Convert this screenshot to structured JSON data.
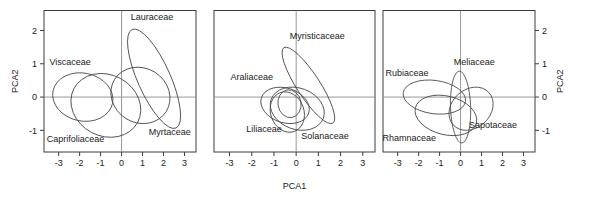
{
  "figure": {
    "type": "multi-panel-pca-ordination",
    "panel_count": 3,
    "axis_titles": {
      "x": "PCA1",
      "y_left": "PCA2",
      "y_right": "PCA2"
    },
    "tick_labels": {
      "x": [
        "-3",
        "-2",
        "-1",
        "0",
        "1",
        "2",
        "3"
      ],
      "y": [
        "2",
        "1",
        "0",
        "-1"
      ]
    },
    "colors": {
      "frame": "#3c3c3c",
      "zero_axis": "#8c8c8c",
      "ellipse": "#4a4a4a",
      "text": "#1a1a1a",
      "background": "#ffffff"
    }
  },
  "chart_data": {
    "type": "scatter",
    "title": "",
    "xlabel": "PCA1",
    "ylabel": "PCA2",
    "xlim": [
      -3.7,
      3.55
    ],
    "ylim": [
      -1.65,
      2.6
    ],
    "xticks": [
      -3,
      -2,
      -1,
      0,
      1,
      2,
      3
    ],
    "yticks": [
      2,
      1,
      0,
      -1
    ],
    "grid": false,
    "legend": "none",
    "annotations": "family names placed adjacent to their confidence ellipses",
    "panels": [
      {
        "index": 1,
        "yaxis_side": "left",
        "ellipses": [
          {
            "label": "Lauraceae",
            "cx": 1.55,
            "cy": 0.55,
            "rx": 0.78,
            "ry": 1.62,
            "rotation": 24,
            "label_x": 1.45,
            "label_y": 2.3
          },
          {
            "label": "Myrtaceae",
            "cx": 0.9,
            "cy": 0.05,
            "rx": 1.45,
            "ry": 0.82,
            "rotation": -32,
            "label_x": 2.3,
            "label_y": -1.15
          },
          {
            "label": "Viscaceae",
            "cx": -1.85,
            "cy": 0.0,
            "rx": 1.45,
            "ry": 0.72,
            "rotation": -12,
            "label_x": -2.45,
            "label_y": 0.95
          },
          {
            "label": "Caprifoliaceae",
            "cx": -0.75,
            "cy": -0.25,
            "rx": 1.72,
            "ry": 0.92,
            "rotation": -28,
            "label_x": -2.2,
            "label_y": -1.35
          }
        ]
      },
      {
        "index": 2,
        "yaxis_side": "none",
        "ellipses": [
          {
            "label": "Myristicaceae",
            "cx": 0.55,
            "cy": 0.35,
            "rx": 0.52,
            "ry": 1.35,
            "rotation": 33,
            "label_x": 0.95,
            "label_y": 1.75
          },
          {
            "label": "Araliaceae",
            "cx": -0.5,
            "cy": -0.25,
            "rx": 1.12,
            "ry": 0.52,
            "rotation": -18,
            "label_x": -2.0,
            "label_y": 0.5
          },
          {
            "label": "Liliaceae",
            "cx": -0.4,
            "cy": -0.45,
            "rx": 0.75,
            "ry": 0.62,
            "rotation": 20,
            "label_x": -1.45,
            "label_y": -1.05
          },
          {
            "label": "Solanaceae",
            "cx": 0.05,
            "cy": -0.35,
            "rx": 1.25,
            "ry": 0.62,
            "rotation": -20,
            "label_x": 1.3,
            "label_y": -1.25
          },
          {
            "label": "",
            "cx": -0.3,
            "cy": -0.2,
            "rx": 0.52,
            "ry": 0.42,
            "rotation": 10,
            "label_x": 0,
            "label_y": 0
          }
        ]
      },
      {
        "index": 3,
        "yaxis_side": "right",
        "ellipses": [
          {
            "label": "Rubiaceae",
            "cx": -1.25,
            "cy": 0.0,
            "rx": 1.5,
            "ry": 0.5,
            "rotation": -8,
            "label_x": -2.55,
            "label_y": 0.62
          },
          {
            "label": "Meliaceae",
            "cx": 0.0,
            "cy": -0.3,
            "rx": 0.48,
            "ry": 1.08,
            "rotation": 2,
            "label_x": 0.65,
            "label_y": 0.95
          },
          {
            "label": "Sapotaceae",
            "cx": 0.5,
            "cy": -0.35,
            "rx": 1.15,
            "ry": 0.58,
            "rotation": 42,
            "label_x": 1.55,
            "label_y": -0.92
          },
          {
            "label": "Rhamnaceae",
            "cx": -0.7,
            "cy": -0.55,
            "rx": 1.5,
            "ry": 0.58,
            "rotation": -14,
            "label_x": -2.45,
            "label_y": -1.32
          }
        ]
      }
    ]
  }
}
